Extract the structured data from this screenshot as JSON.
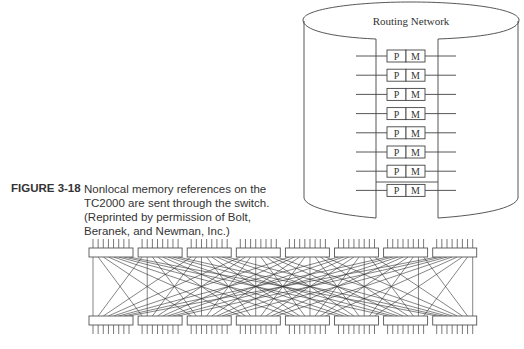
{
  "figure": {
    "label": "FIGURE 3-18",
    "caption_lines": [
      "Nonlocal memory references on the",
      "TC2000 are sent through the switch.",
      "(Reprinted by permission of Bolt,",
      "Beranek, and Newman, Inc.)"
    ]
  },
  "routing_network": {
    "title": "Routing Network",
    "nodes": [
      {
        "p": "P",
        "m": "M"
      },
      {
        "p": "P",
        "m": "M"
      },
      {
        "p": "P",
        "m": "M"
      },
      {
        "p": "P",
        "m": "M"
      },
      {
        "p": "P",
        "m": "M"
      },
      {
        "p": "P",
        "m": "M"
      },
      {
        "p": "P",
        "m": "M"
      },
      {
        "p": "P",
        "m": "M"
      }
    ]
  },
  "switch": {
    "stages": 2,
    "boxes_per_stage": 8,
    "pins_per_box": 8
  }
}
